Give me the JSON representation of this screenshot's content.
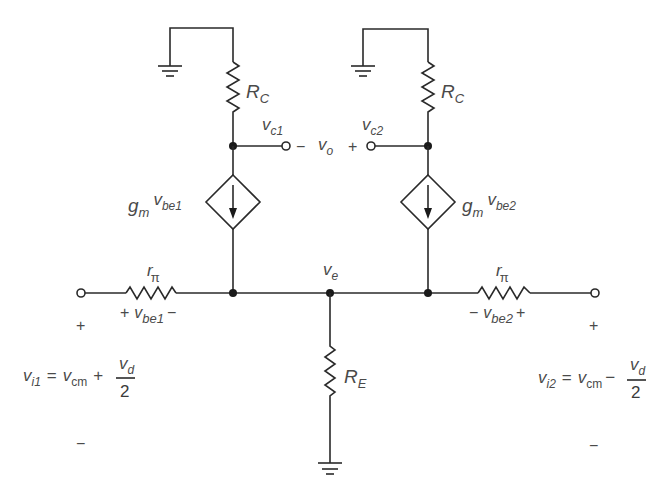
{
  "diagram": {
    "colors": {
      "wire": "#2a2a2a",
      "text": "#4a4a4a",
      "background": "#ffffff"
    },
    "components": {
      "rc_left": {
        "main": "R",
        "sub": "C"
      },
      "rc_right": {
        "main": "R",
        "sub": "C"
      },
      "re": {
        "main": "R",
        "sub": "E"
      },
      "rpi_left": {
        "main": "r",
        "sub": "π"
      },
      "rpi_right": {
        "main": "r",
        "sub": "π"
      },
      "source_left": {
        "gm": "g",
        "gm_sub": "m",
        "v": "v",
        "v_sub": "be1"
      },
      "source_right": {
        "gm": "g",
        "gm_sub": "m",
        "v": "v",
        "v_sub": "be2"
      }
    },
    "nodes": {
      "vc1": {
        "main": "v",
        "sub": "c1"
      },
      "vc2": {
        "main": "v",
        "sub": "c2"
      },
      "ve": {
        "main": "v",
        "sub": "e"
      },
      "vo": {
        "main": "v",
        "sub": "o",
        "minus": "−",
        "plus": "+"
      }
    },
    "vbe1": {
      "plus": "+",
      "main": "v",
      "sub": "be1",
      "minus": "−"
    },
    "vbe2": {
      "minus": "−",
      "main": "v",
      "sub": "be2",
      "plus": "+"
    },
    "input_left": {
      "plus": "+",
      "minus": "−",
      "lhs": "v",
      "lhs_sub": "i1",
      "eq": "=",
      "cm": "v",
      "cm_sub": "cm",
      "op": "+",
      "num": "v",
      "num_sub": "d",
      "den": "2"
    },
    "input_right": {
      "plus": "+",
      "minus": "−",
      "lhs": "v",
      "lhs_sub": "i2",
      "eq": "=",
      "cm": "v",
      "cm_sub": "cm",
      "op": "−",
      "num": "v",
      "num_sub": "d",
      "den": "2"
    }
  }
}
